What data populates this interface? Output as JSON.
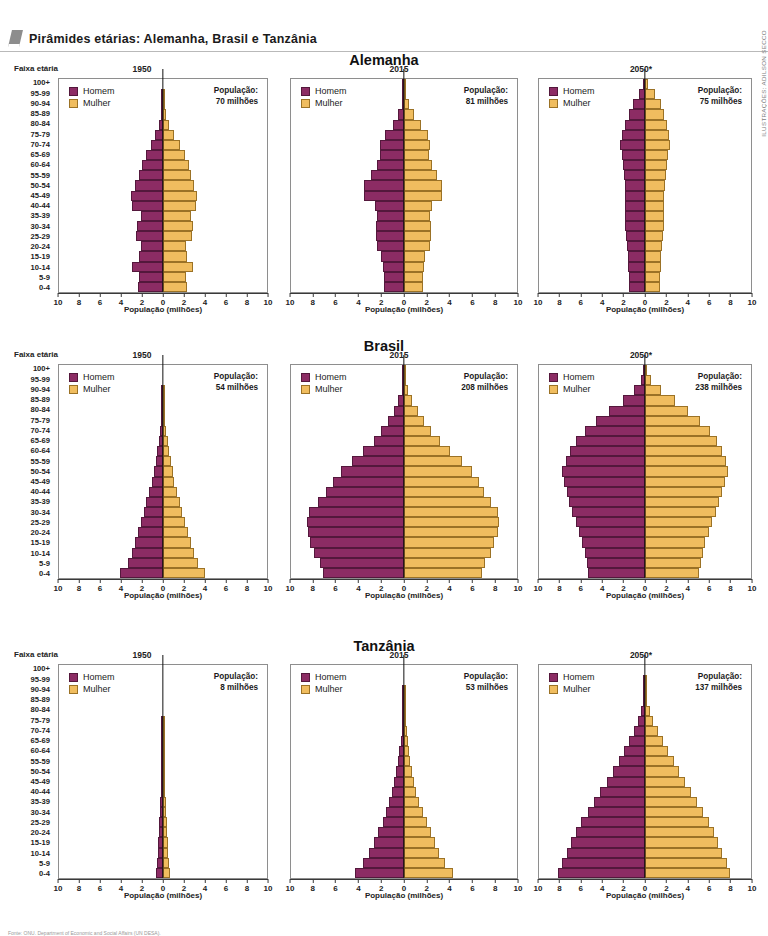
{
  "header": {
    "title": "Pirâmides etárias: Alemanha, Brasil e Tanzânia",
    "flag_icon": "flag-icon"
  },
  "credit": "ILUSTRAÇÕES: ADILSON SECCO",
  "source": "Fonte: ONU. Department of Economic and Social Affairs (UN DESA).",
  "labels": {
    "faixa_etaria": "Faixa etária",
    "x_title": "População (milhões)",
    "legend_male": "Homem",
    "legend_female": "Mulher",
    "population_label": "População:"
  },
  "colors": {
    "male": "#8c2c64",
    "female": "#f0bd5f",
    "axis": "#3a3a3a",
    "frame": "#8e8e8e"
  },
  "age_groups": [
    "0-4",
    "5-9",
    "10-14",
    "15-19",
    "20-24",
    "25-29",
    "30-34",
    "35-39",
    "40-44",
    "45-49",
    "50-54",
    "55-59",
    "60-64",
    "65-69",
    "70-74",
    "75-79",
    "80-84",
    "85-89",
    "90-94",
    "95-99",
    "100+"
  ],
  "x_ticks": [
    "10",
    "8",
    "6",
    "4",
    "2",
    "0",
    "2",
    "4",
    "6",
    "8",
    "10"
  ],
  "chart_data": [
    {
      "type": "bar",
      "chart_id": "alemanha-1950",
      "country": "Alemanha",
      "title": "Alemanha",
      "year": "1950",
      "population": "70 milhões",
      "xlabel": "População (milhões)",
      "ylabel": "Faixa etária",
      "xlim": [
        -10,
        10
      ],
      "grid": false,
      "legend": "top-left",
      "categories": [
        "0-4",
        "5-9",
        "10-14",
        "15-19",
        "20-24",
        "25-29",
        "30-34",
        "35-39",
        "40-44",
        "45-49",
        "50-54",
        "55-59",
        "60-64",
        "65-69",
        "70-74",
        "75-79",
        "80-84",
        "85-89",
        "90-94",
        "95-99",
        "100+"
      ],
      "series": [
        {
          "name": "Homem",
          "values": [
            2.4,
            2.3,
            3.0,
            2.3,
            2.1,
            2.6,
            2.5,
            2.1,
            3.0,
            3.1,
            2.7,
            2.3,
            2.0,
            1.6,
            1.2,
            0.8,
            0.4,
            0.15,
            0.04,
            0.01,
            0.0
          ]
        },
        {
          "name": "Mulher",
          "values": [
            2.3,
            2.2,
            2.9,
            2.3,
            2.2,
            2.8,
            2.9,
            2.7,
            3.2,
            3.3,
            3.0,
            2.7,
            2.5,
            2.1,
            1.6,
            1.1,
            0.6,
            0.25,
            0.07,
            0.015,
            0.0
          ]
        }
      ]
    },
    {
      "type": "bar",
      "chart_id": "alemanha-2015",
      "country": "Alemanha",
      "title": "Alemanha",
      "year": "2015",
      "population": "81 milhões",
      "xlabel": "População (milhões)",
      "ylabel": "Faixa etária",
      "xlim": [
        -10,
        10
      ],
      "grid": false,
      "legend": "top-left",
      "categories": [
        "0-4",
        "5-9",
        "10-14",
        "15-19",
        "20-24",
        "25-29",
        "30-34",
        "35-39",
        "40-44",
        "45-49",
        "50-54",
        "55-59",
        "60-64",
        "65-69",
        "70-74",
        "75-79",
        "80-84",
        "85-89",
        "90-94",
        "95-99",
        "100+"
      ],
      "series": [
        {
          "name": "Homem",
          "values": [
            1.8,
            1.8,
            1.9,
            2.0,
            2.4,
            2.5,
            2.5,
            2.4,
            2.6,
            3.5,
            3.5,
            2.9,
            2.4,
            2.1,
            2.1,
            1.7,
            1.0,
            0.5,
            0.2,
            0.04,
            0.01
          ]
        },
        {
          "name": "Mulher",
          "values": [
            1.7,
            1.7,
            1.8,
            1.9,
            2.3,
            2.4,
            2.4,
            2.3,
            2.5,
            3.4,
            3.4,
            2.9,
            2.5,
            2.2,
            2.3,
            2.1,
            1.5,
            0.9,
            0.45,
            0.1,
            0.02
          ]
        }
      ]
    },
    {
      "type": "bar",
      "chart_id": "alemanha-2050",
      "country": "Alemanha",
      "title": "Alemanha",
      "year": "2050*",
      "population": "75 milhões",
      "xlabel": "População (milhões)",
      "ylabel": "Faixa etária",
      "xlim": [
        -10,
        10
      ],
      "grid": false,
      "legend": "top-left",
      "categories": [
        "0-4",
        "5-9",
        "10-14",
        "15-19",
        "20-24",
        "25-29",
        "30-34",
        "35-39",
        "40-44",
        "45-49",
        "50-54",
        "55-59",
        "60-64",
        "65-69",
        "70-74",
        "75-79",
        "80-84",
        "85-89",
        "90-94",
        "95-99",
        "100+"
      ],
      "series": [
        {
          "name": "Homem",
          "values": [
            1.5,
            1.5,
            1.6,
            1.6,
            1.7,
            1.8,
            1.9,
            1.9,
            1.9,
            1.9,
            1.9,
            2.0,
            2.1,
            2.2,
            2.4,
            2.2,
            1.9,
            1.5,
            1.1,
            0.55,
            0.12
          ]
        },
        {
          "name": "Mulher",
          "values": [
            1.4,
            1.4,
            1.5,
            1.5,
            1.6,
            1.7,
            1.8,
            1.8,
            1.8,
            1.8,
            1.9,
            2.0,
            2.1,
            2.2,
            2.4,
            2.3,
            2.1,
            1.8,
            1.5,
            0.9,
            0.3
          ]
        }
      ]
    },
    {
      "type": "bar",
      "chart_id": "brasil-1950",
      "country": "Brasil",
      "title": "Brasil",
      "year": "1950",
      "population": "54 milhões",
      "xlabel": "População (milhões)",
      "ylabel": "Faixa etária",
      "xlim": [
        -10,
        10
      ],
      "grid": false,
      "legend": "top-left",
      "categories": [
        "0-4",
        "5-9",
        "10-14",
        "15-19",
        "20-24",
        "25-29",
        "30-34",
        "35-39",
        "40-44",
        "45-49",
        "50-54",
        "55-59",
        "60-64",
        "65-69",
        "70-74",
        "75-79",
        "80-84",
        "85-89",
        "90-94",
        "95-99",
        "100+"
      ],
      "series": [
        {
          "name": "Homem",
          "values": [
            4.1,
            3.4,
            3.0,
            2.7,
            2.4,
            2.1,
            1.8,
            1.6,
            1.3,
            1.1,
            0.9,
            0.7,
            0.55,
            0.4,
            0.27,
            0.16,
            0.08,
            0.03,
            0.01,
            0.0,
            0.0
          ]
        },
        {
          "name": "Mulher",
          "values": [
            4.0,
            3.4,
            3.0,
            2.7,
            2.4,
            2.1,
            1.8,
            1.6,
            1.35,
            1.1,
            0.95,
            0.75,
            0.6,
            0.45,
            0.3,
            0.18,
            0.1,
            0.04,
            0.012,
            0.0,
            0.0
          ]
        }
      ]
    },
    {
      "type": "bar",
      "chart_id": "brasil-2015",
      "country": "Brasil",
      "title": "Brasil",
      "year": "2015",
      "population": "208 milhões",
      "xlabel": "População (milhões)",
      "ylabel": "Faixa etária",
      "xlim": [
        -10,
        10
      ],
      "grid": false,
      "legend": "top-left",
      "categories": [
        "0-4",
        "5-9",
        "10-14",
        "15-19",
        "20-24",
        "25-29",
        "30-34",
        "35-39",
        "40-44",
        "45-49",
        "50-54",
        "55-59",
        "60-64",
        "65-69",
        "70-74",
        "75-79",
        "80-84",
        "85-89",
        "90-94",
        "95-99",
        "100+"
      ],
      "series": [
        {
          "name": "Homem",
          "values": [
            7.2,
            7.4,
            8.0,
            8.3,
            8.5,
            8.6,
            8.4,
            7.6,
            6.9,
            6.3,
            5.6,
            4.6,
            3.6,
            2.7,
            2.0,
            1.4,
            0.9,
            0.5,
            0.22,
            0.07,
            0.015
          ]
        },
        {
          "name": "Mulher",
          "values": [
            6.9,
            7.2,
            7.7,
            8.0,
            8.3,
            8.4,
            8.3,
            7.7,
            7.1,
            6.6,
            6.0,
            5.1,
            4.1,
            3.2,
            2.4,
            1.8,
            1.2,
            0.75,
            0.35,
            0.12,
            0.03
          ]
        }
      ]
    },
    {
      "type": "bar",
      "chart_id": "brasil-2050",
      "country": "Brasil",
      "title": "Brasil",
      "year": "2050*",
      "population": "238 milhões",
      "xlabel": "População (milhões)",
      "ylabel": "Faixa etária",
      "xlim": [
        -10,
        10
      ],
      "grid": false,
      "legend": "top-left",
      "categories": [
        "0-4",
        "5-9",
        "10-14",
        "15-19",
        "20-24",
        "25-29",
        "30-34",
        "35-39",
        "40-44",
        "45-49",
        "50-54",
        "55-59",
        "60-64",
        "65-69",
        "70-74",
        "75-79",
        "80-84",
        "85-89",
        "90-94",
        "95-99",
        "100+"
      ],
      "series": [
        {
          "name": "Homem",
          "values": [
            5.4,
            5.5,
            5.7,
            5.9,
            6.2,
            6.5,
            6.9,
            7.2,
            7.4,
            7.6,
            7.8,
            7.5,
            7.1,
            6.5,
            5.7,
            4.6,
            3.4,
            2.1,
            1.0,
            0.35,
            0.07
          ]
        },
        {
          "name": "Mulher",
          "values": [
            5.1,
            5.3,
            5.5,
            5.7,
            6.0,
            6.3,
            6.7,
            7.0,
            7.3,
            7.5,
            7.8,
            7.6,
            7.3,
            6.8,
            6.1,
            5.2,
            4.1,
            2.8,
            1.5,
            0.6,
            0.15
          ]
        }
      ]
    },
    {
      "type": "bar",
      "chart_id": "tanzania-1950",
      "country": "Tanzânia",
      "title": "Tanzânia",
      "year": "1950",
      "population": "8 milhões",
      "xlabel": "População (milhões)",
      "ylabel": "Faixa etária",
      "xlim": [
        -10,
        10
      ],
      "grid": false,
      "legend": "top-left",
      "categories": [
        "0-4",
        "5-9",
        "10-14",
        "15-19",
        "20-24",
        "25-29",
        "30-34",
        "35-39",
        "40-44",
        "45-49",
        "50-54",
        "55-59",
        "60-64",
        "65-69",
        "70-74",
        "75-79",
        "80-84",
        "85-89",
        "90-94",
        "95-99",
        "100+"
      ],
      "series": [
        {
          "name": "Homem",
          "values": [
            0.72,
            0.58,
            0.5,
            0.45,
            0.41,
            0.37,
            0.32,
            0.27,
            0.22,
            0.17,
            0.13,
            0.09,
            0.06,
            0.035,
            0.02,
            0.008,
            0.003,
            0.001,
            0.0,
            0.0,
            0.0
          ]
        },
        {
          "name": "Mulher",
          "values": [
            0.72,
            0.58,
            0.5,
            0.45,
            0.42,
            0.38,
            0.33,
            0.28,
            0.23,
            0.18,
            0.14,
            0.1,
            0.07,
            0.04,
            0.022,
            0.009,
            0.004,
            0.001,
            0.0,
            0.0,
            0.0
          ]
        }
      ]
    },
    {
      "type": "bar",
      "chart_id": "tanzania-2015",
      "country": "Tanzânia",
      "title": "Tanzânia",
      "year": "2015",
      "population": "53 milhões",
      "xlabel": "População (milhões)",
      "ylabel": "Faixa etária",
      "xlim": [
        -10,
        10
      ],
      "grid": false,
      "legend": "top-left",
      "categories": [
        "0-4",
        "5-9",
        "10-14",
        "15-19",
        "20-24",
        "25-29",
        "30-34",
        "35-39",
        "40-44",
        "45-49",
        "50-54",
        "55-59",
        "60-64",
        "65-69",
        "70-74",
        "75-79",
        "80-84",
        "85-89",
        "90-94",
        "95-99",
        "100+"
      ],
      "series": [
        {
          "name": "Homem",
          "values": [
            4.3,
            3.6,
            3.1,
            2.7,
            2.3,
            1.9,
            1.6,
            1.3,
            1.05,
            0.85,
            0.68,
            0.52,
            0.4,
            0.29,
            0.2,
            0.12,
            0.06,
            0.025,
            0.008,
            0.002,
            0.0
          ]
        },
        {
          "name": "Mulher",
          "values": [
            4.3,
            3.6,
            3.1,
            2.7,
            2.35,
            2.0,
            1.65,
            1.35,
            1.1,
            0.9,
            0.72,
            0.56,
            0.44,
            0.33,
            0.23,
            0.14,
            0.075,
            0.03,
            0.01,
            0.002,
            0.0
          ]
        }
      ]
    },
    {
      "type": "bar",
      "chart_id": "tanzania-2050",
      "country": "Tanzânia",
      "title": "Tanzânia",
      "year": "2050*",
      "population": "137 milhões",
      "xlabel": "População (milhões)",
      "ylabel": "Faixa etária",
      "xlim": [
        -10,
        10
      ],
      "grid": false,
      "legend": "top-left",
      "categories": [
        "0-4",
        "5-9",
        "10-14",
        "15-19",
        "20-24",
        "25-29",
        "30-34",
        "35-39",
        "40-44",
        "45-49",
        "50-54",
        "55-59",
        "60-64",
        "65-69",
        "70-74",
        "75-79",
        "80-84",
        "85-89",
        "90-94",
        "95-99",
        "100+"
      ],
      "series": [
        {
          "name": "Homem",
          "values": [
            8.2,
            7.8,
            7.4,
            7.0,
            6.5,
            6.0,
            5.4,
            4.8,
            4.2,
            3.6,
            3.0,
            2.5,
            2.0,
            1.5,
            1.05,
            0.65,
            0.35,
            0.15,
            0.05,
            0.012,
            0.002
          ]
        },
        {
          "name": "Mulher",
          "values": [
            8.0,
            7.7,
            7.3,
            6.9,
            6.5,
            6.0,
            5.5,
            4.9,
            4.35,
            3.8,
            3.2,
            2.7,
            2.2,
            1.7,
            1.25,
            0.8,
            0.45,
            0.2,
            0.07,
            0.018,
            0.003
          ]
        }
      ]
    }
  ]
}
